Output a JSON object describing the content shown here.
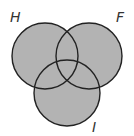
{
  "diagram": {
    "type": "venn",
    "fill_color": "#b3b3b3",
    "stroke_color": "#222222",
    "sets": [
      {
        "label": "H",
        "cx": 45,
        "cy": 56,
        "r": 33,
        "label_x": 10,
        "label_y": 22
      },
      {
        "label": "F",
        "cx": 89,
        "cy": 56,
        "r": 33,
        "label_x": 116,
        "label_y": 22
      },
      {
        "label": "I",
        "cx": 67,
        "cy": 93,
        "r": 33,
        "label_x": 92,
        "label_y": 132
      }
    ]
  }
}
